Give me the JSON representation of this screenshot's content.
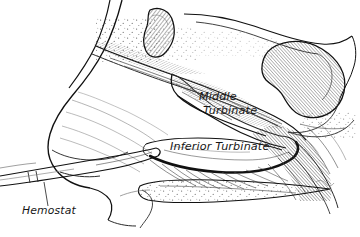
{
  "figure": {
    "kind": "medical-line-illustration",
    "background_color": "#ffffff",
    "ink_color": "#111111",
    "technique": "pen-and-ink hatching and stippling",
    "width": 360,
    "height": 237
  },
  "labels": {
    "middle_turbinate_line1": "Middle",
    "middle_turbinate_line2": "Turbinate",
    "inferior_turbinate": "Inferior Turbinate",
    "hemostat": "Hemostat"
  },
  "structures": [
    {
      "name": "frontal-sinus-mass",
      "description": "pear-shaped hatched sinus, upper center"
    },
    {
      "name": "sphenoid-sinus-mass",
      "description": "large kidney-bean hatched mass, upper right"
    },
    {
      "name": "nasal-dorsum",
      "description": "external nose profile, left"
    },
    {
      "name": "middle-turbinate",
      "description": "curved hatched shelf, center"
    },
    {
      "name": "inferior-turbinate",
      "description": "bold-outlined hooked shelf, center-low"
    },
    {
      "name": "hard-palate",
      "description": "tapering stippled wedge, lower center"
    },
    {
      "name": "nasopharynx",
      "description": "densely hatched posterior wall, right"
    },
    {
      "name": "hemostat-instrument",
      "description": "long slender clamp entering nostril from lower left"
    }
  ]
}
